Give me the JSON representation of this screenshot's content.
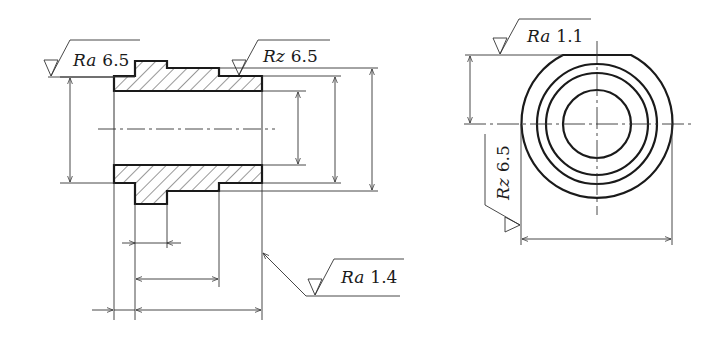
{
  "drawing": {
    "title": "Bushing technical drawing with surface roughness annotations",
    "views": [
      {
        "name": "sectional-front-view",
        "annotations": [
          {
            "param": "Ra",
            "value": "6.5",
            "location": "left outer top"
          },
          {
            "param": "Rz",
            "value": "6.5",
            "location": "top outer right"
          },
          {
            "param": "Ra",
            "value": "1.4",
            "location": "right end face"
          }
        ]
      },
      {
        "name": "end-view",
        "annotations": [
          {
            "param": "Ra",
            "value": "1.1",
            "location": "flat top"
          },
          {
            "param": "Rz",
            "value": "6.5",
            "location": "left outer, vertical"
          }
        ]
      }
    ]
  },
  "labels": {
    "ra_left_param": "Ra",
    "ra_left_value": "6.5",
    "rz_top_param": "Rz",
    "rz_top_value": "6.5",
    "ra_end_param": "Ra",
    "ra_end_value": "1.4",
    "ra_right_param": "Ra",
    "ra_right_value": "1.1",
    "rz_right_param": "Rz",
    "rz_right_value": "6.5"
  },
  "colors": {
    "line": "#1a1a1a",
    "thin": "#333333",
    "background": "#ffffff"
  }
}
